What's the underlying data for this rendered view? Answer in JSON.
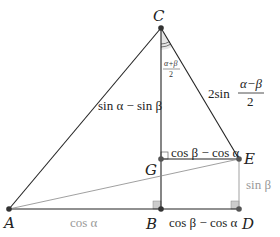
{
  "points": {
    "A": {
      "label": "A",
      "x": 9,
      "y": 209
    },
    "B": {
      "label": "B",
      "x": 161,
      "y": 209
    },
    "C": {
      "label": "C",
      "x": 161,
      "y": 28
    },
    "D": {
      "label": "D",
      "x": 239,
      "y": 209
    },
    "E": {
      "label": "E",
      "x": 239,
      "y": 159
    },
    "G": {
      "label": "G",
      "x": 161,
      "y": 159
    }
  },
  "labels": {
    "CG": "sin α − sin β",
    "CE_coef": "2sin",
    "CE_num": "α−β",
    "CE_den": "2",
    "angle_num": "α+β",
    "angle_den": "2",
    "GE": "cos β − cos α",
    "BD": "cos β − cos α",
    "ED": "sin β",
    "AB": "cos α"
  },
  "colors": {
    "line": "#222222",
    "gray_line": "#aaaaaa",
    "gray_text": "#999999",
    "right_angle_fill": "#cccccc",
    "angle_fill": "#e6e6e6"
  }
}
